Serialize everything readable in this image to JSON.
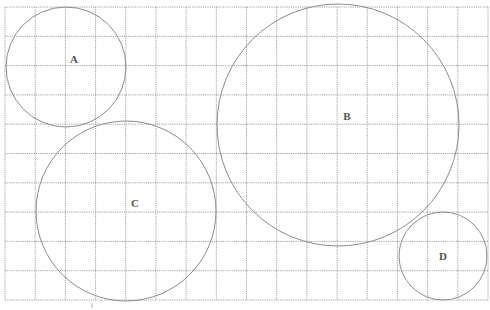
{
  "diagram": {
    "grid": {
      "x0": 5,
      "y0": 7,
      "x1": 488,
      "y1": 300,
      "cols": 16,
      "rows": 10,
      "color": "#8a8a8a"
    },
    "circles": [
      {
        "label": "A",
        "cx": 66,
        "cy": 67,
        "r": 60,
        "label_x": 74,
        "label_y": 60
      },
      {
        "label": "B",
        "cx": 338,
        "cy": 125,
        "r": 121,
        "label_x": 347,
        "label_y": 117
      },
      {
        "label": "C",
        "cx": 126,
        "cy": 211,
        "r": 90,
        "label_x": 135,
        "label_y": 204
      },
      {
        "label": "D",
        "cx": 443,
        "cy": 256,
        "r": 44,
        "label_x": 443,
        "label_y": 257
      }
    ],
    "stroke_color": "#8c8c8c",
    "label_color": "#555555"
  }
}
